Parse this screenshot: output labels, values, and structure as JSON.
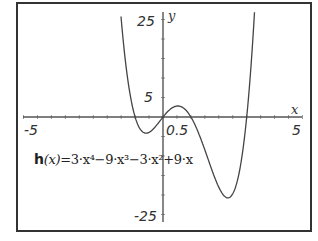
{
  "chart_data": {
    "type": "line",
    "title": "",
    "function_label": "h(x)=3·x⁴−9·x³−3·x²+9·x",
    "function_name": "h",
    "function_args": "(x)",
    "function_body": "=3·x⁴−9·x³−3·x²+9·x",
    "coefficients": [
      3,
      -9,
      -3,
      9,
      0
    ],
    "xlabel": "x",
    "ylabel": "y",
    "xlim": [
      -5,
      5
    ],
    "ylim": [
      -27,
      27
    ],
    "x_tick_labels": [
      "-5",
      "0.5",
      "5"
    ],
    "y_tick_labels": [
      "25",
      "5",
      "-25"
    ],
    "roots": [
      -1,
      0,
      1,
      3
    ],
    "series": [
      {
        "name": "h(x)",
        "x": [
          -1.5,
          -1.25,
          -1.0,
          -0.75,
          -0.5,
          -0.25,
          0,
          0.25,
          0.5,
          0.75,
          1.0,
          1.5,
          2.0,
          2.25,
          2.5,
          2.75,
          3.0,
          3.25,
          3.5
        ],
        "y": [
          20.3,
          6.5,
          0,
          -2.5,
          -2.8,
          -1.9,
          0,
          1.6,
          2.1,
          1.3,
          0,
          -5.6,
          -18,
          -22.0,
          -20.6,
          -13.1,
          0,
          19.3,
          46.9
        ]
      }
    ],
    "grid": false,
    "legend": "none"
  },
  "labels": {
    "x_neg5": "-5",
    "x_05": "0.5",
    "x_5": "5",
    "y_25": "25",
    "y_5": "5",
    "y_neg25": "-25",
    "x_axis": "x",
    "y_axis": "y"
  },
  "colors": {
    "frame": "#333333",
    "axis": "#555555",
    "curve": "#444444"
  }
}
